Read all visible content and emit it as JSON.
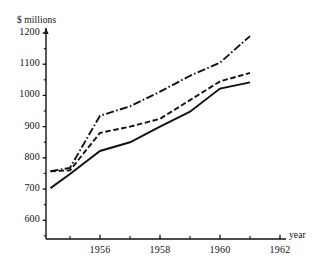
{
  "chart_data": {
    "type": "line",
    "title": "",
    "subtitle": "",
    "xlabel": "year",
    "ylabel": "$ millions",
    "xlim": [
      1954.2,
      1962.6
    ],
    "ylim": [
      540,
      1210
    ],
    "grid": false,
    "legend": "none",
    "x_ticks_major": [
      1956,
      1958,
      1960,
      1962
    ],
    "x_tick_labels": [
      "1956",
      "1958",
      "1960",
      "1962"
    ],
    "x_ticks_minor": [
      1955,
      1957,
      1959,
      1961
    ],
    "y_ticks_major": [
      600,
      700,
      800,
      900,
      1000,
      1100,
      1200
    ],
    "y_tick_labels": [
      "600",
      "700",
      "800",
      "900",
      "1000",
      "1100",
      "1200"
    ],
    "y_ticks_minor": [
      550,
      650,
      750,
      850,
      950,
      1050,
      1150
    ],
    "x": [
      1954.35,
      1955,
      1956,
      1957,
      1958,
      1959,
      1960,
      1961
    ],
    "series": [
      {
        "name": "upper",
        "style": "dash-dot",
        "values": [
          757,
          768,
          935,
          965,
          1012,
          1063,
          1105,
          1190
        ]
      },
      {
        "name": "middle",
        "style": "dashed",
        "values": [
          757,
          760,
          880,
          900,
          925,
          985,
          1045,
          1072
        ]
      },
      {
        "name": "lower",
        "style": "solid",
        "values": [
          703,
          748,
          822,
          850,
          900,
          948,
          1022,
          1042
        ]
      }
    ]
  },
  "axes": {
    "y_title": "$ millions",
    "x_title": "year"
  },
  "style": {
    "line_color": "#111111",
    "axis_color": "#111111",
    "background": "#ffffff"
  }
}
